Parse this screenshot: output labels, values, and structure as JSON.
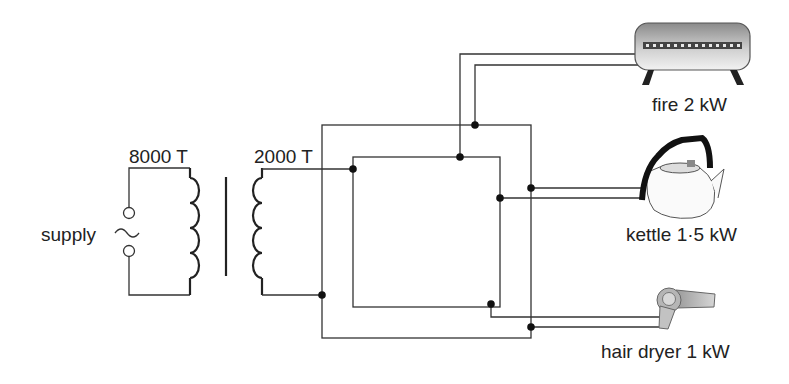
{
  "diagram": {
    "type": "transformer-circuit",
    "primary": {
      "label": "8000 T",
      "turns": 8000
    },
    "secondary": {
      "label": "2000 T",
      "turns": 2000
    },
    "supply": {
      "label": "supply",
      "symbol": "ac-source-icon"
    },
    "appliances": [
      {
        "id": "fire",
        "label": "fire 2 kW",
        "power_kw": 2
      },
      {
        "id": "kettle",
        "label": "kettle 1·5 kW",
        "power_kw": 1.5
      },
      {
        "id": "hair-dryer",
        "label": "hair dryer 1 kW",
        "power_kw": 1
      }
    ],
    "colors": {
      "wire": "#333333",
      "junction": "#111111",
      "text": "#222222"
    }
  }
}
